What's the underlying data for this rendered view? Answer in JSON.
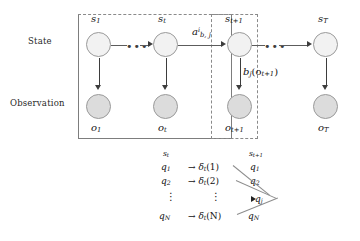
{
  "figure": {
    "type": "hmm-trellis-diagram",
    "row_labels": {
      "state": "State",
      "observation": "Observation"
    },
    "state_nodes": [
      {
        "id": "s1",
        "label_base": "s",
        "label_sub": "1",
        "x": 86,
        "y": 32
      },
      {
        "id": "st",
        "label_base": "s",
        "label_sub": "t",
        "x": 153,
        "y": 32
      },
      {
        "id": "st1",
        "label_base": "s",
        "label_sub": "t+1",
        "x": 227,
        "y": 32
      },
      {
        "id": "sT",
        "label_base": "s",
        "label_sub": "T",
        "x": 313,
        "y": 32
      }
    ],
    "observation_nodes": [
      {
        "id": "o1",
        "label_base": "o",
        "label_sub": "1",
        "x": 86,
        "y": 94
      },
      {
        "id": "ot",
        "label_base": "o",
        "label_sub": "t",
        "x": 153,
        "y": 94
      },
      {
        "id": "ot1",
        "label_base": "o",
        "label_sub": "t+1",
        "x": 227,
        "y": 94
      },
      {
        "id": "oT",
        "label_base": "o",
        "label_sub": "T",
        "x": 313,
        "y": 94
      }
    ],
    "transition_label": {
      "base": "a",
      "sup": "i",
      "sub": "b, j"
    },
    "emission_label": {
      "text": "b",
      "sub": "j",
      "arg": "(o",
      "arg_sub": "t+1",
      "arg_close": ")"
    },
    "ellipsis": "•••"
  },
  "trellis": {
    "header_left": {
      "base": "s",
      "sub": "t"
    },
    "header_right": {
      "base": "s",
      "sub": "t+1"
    },
    "rows": [
      {
        "left": "q",
        "left_sub": "1",
        "arrow": "→",
        "delta": "δ",
        "delta_sub": "t",
        "delta_arg": "(1)",
        "right": "q",
        "right_sub": "1"
      },
      {
        "left": "q",
        "left_sub": "2",
        "arrow": "→",
        "delta": "δ",
        "delta_sub": "t",
        "delta_arg": "(2)",
        "right": "q",
        "right_sub": "2"
      },
      {
        "left": "q",
        "left_sub": "N",
        "arrow": "→",
        "delta": "δ",
        "delta_sub": "t",
        "delta_arg": "(N)",
        "right": "q",
        "right_sub": "N"
      }
    ],
    "vertical_dots": "⋮",
    "target": {
      "base": "q",
      "sub": "j"
    }
  },
  "colors": {
    "state_fill": "#f2f2f2",
    "observation_fill": "#dcdcdc",
    "node_stroke": "#9a9a9a",
    "arrow": "#3d3d3d",
    "plate_solid": "#7d7d7d",
    "plate_dashed": "#8a8a8a",
    "text": "#1a1a1a",
    "background": "#ffffff"
  }
}
